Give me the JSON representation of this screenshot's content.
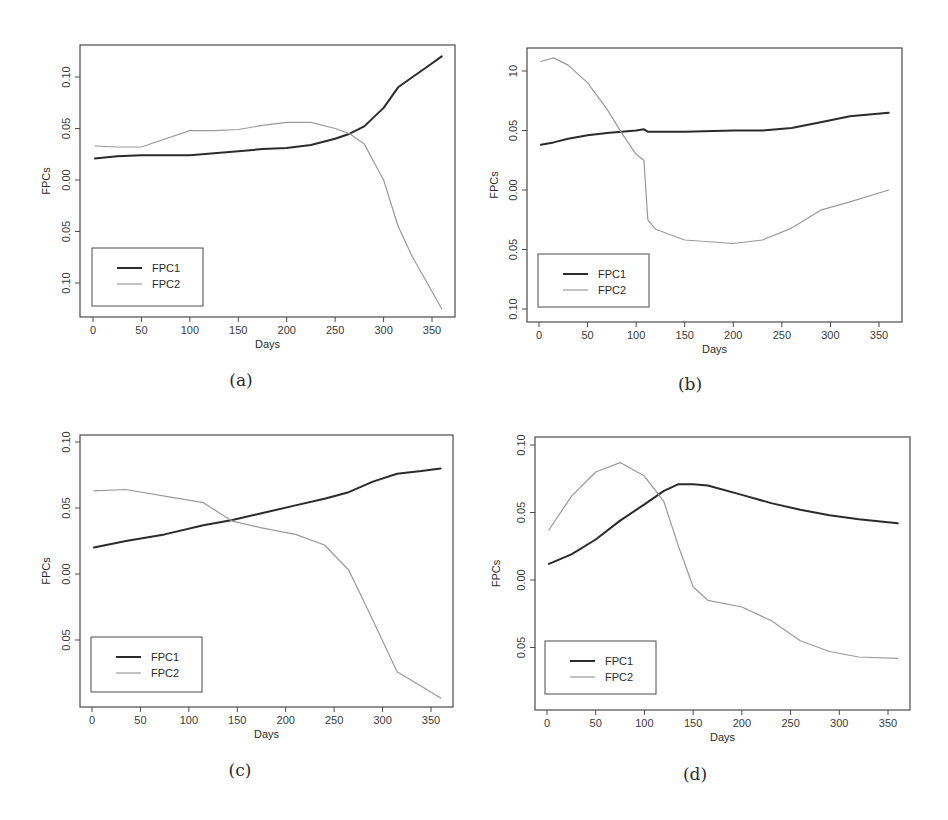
{
  "figure": {
    "panels": [
      "a",
      "b",
      "c",
      "d"
    ]
  },
  "chart_data": [
    {
      "panel": "a",
      "caption": "(a)",
      "type": "line",
      "title": "",
      "xlabel": "Days",
      "ylabel": "FPCs",
      "xticks": [
        0,
        50,
        100,
        150,
        200,
        250,
        300,
        350
      ],
      "xtick_labels": [
        "0",
        "50",
        "100",
        "150",
        "200",
        "250",
        "300",
        "350"
      ],
      "yticks": [
        0.1,
        0.05,
        0.0,
        -0.05,
        -0.1
      ],
      "ytick_labels": [
        "0.10",
        "0.05",
        "0.00",
        "0.05",
        "0.10"
      ],
      "xlim": [
        -12,
        372
      ],
      "ylim": [
        -0.133,
        0.13
      ],
      "grid": false,
      "legend_position": "bottom-left",
      "legend": [
        "FPC1",
        "FPC2"
      ],
      "x": [
        2,
        25,
        50,
        75,
        100,
        125,
        150,
        175,
        200,
        225,
        250,
        265,
        280,
        300,
        315,
        330,
        345,
        360
      ],
      "series": [
        {
          "name": "FPC1",
          "color": "#2b2b2b",
          "width": 2,
          "values": [
            0.021,
            0.023,
            0.024,
            0.024,
            0.024,
            0.026,
            0.028,
            0.03,
            0.031,
            0.034,
            0.04,
            0.045,
            0.052,
            0.07,
            0.09,
            0.1,
            0.11,
            0.12
          ]
        },
        {
          "name": "FPC2",
          "color": "#9a9a9a",
          "width": 1.2,
          "values": [
            0.033,
            0.032,
            0.032,
            0.04,
            0.048,
            0.048,
            0.049,
            0.053,
            0.056,
            0.056,
            0.05,
            0.045,
            0.035,
            0.0,
            -0.045,
            -0.075,
            -0.1,
            -0.125
          ]
        }
      ]
    },
    {
      "panel": "b",
      "caption": "(b)",
      "type": "line",
      "title": "",
      "xlabel": "Days",
      "ylabel": "FPCs",
      "xticks": [
        0,
        50,
        100,
        150,
        200,
        250,
        300,
        350
      ],
      "xtick_labels": [
        "0",
        "50",
        "100",
        "150",
        "200",
        "250",
        "300",
        "350"
      ],
      "yticks": [
        0.1,
        0.05,
        0.0,
        -0.05,
        -0.1
      ],
      "ytick_labels": [
        "10",
        "0.05",
        "0.00",
        "0.05",
        "0.10"
      ],
      "xlim": [
        -12,
        372
      ],
      "ylim": [
        -0.11,
        0.12
      ],
      "grid": false,
      "legend_position": "bottom-left",
      "legend": [
        "FPC1",
        "FPC2"
      ],
      "x": [
        2,
        15,
        30,
        50,
        70,
        85,
        100,
        108,
        112,
        120,
        150,
        200,
        230,
        260,
        290,
        320,
        360
      ],
      "series": [
        {
          "name": "FPC1",
          "color": "#2b2b2b",
          "width": 2,
          "values": [
            0.038,
            0.04,
            0.043,
            0.046,
            0.048,
            0.049,
            0.05,
            0.051,
            0.049,
            0.049,
            0.049,
            0.05,
            0.05,
            0.052,
            0.057,
            0.062,
            0.065
          ]
        },
        {
          "name": "FPC2",
          "color": "#9a9a9a",
          "width": 1.2,
          "values": [
            0.108,
            0.111,
            0.105,
            0.09,
            0.068,
            0.048,
            0.03,
            0.025,
            -0.025,
            -0.033,
            -0.042,
            -0.045,
            -0.042,
            -0.032,
            -0.017,
            -0.01,
            0.0
          ]
        }
      ]
    },
    {
      "panel": "c",
      "caption": "(c)",
      "type": "line",
      "title": "",
      "xlabel": "Days",
      "ylabel": "FPCs",
      "xticks": [
        0,
        50,
        100,
        150,
        200,
        250,
        300,
        350
      ],
      "xtick_labels": [
        "0",
        "50",
        "100",
        "150",
        "200",
        "250",
        "300",
        "350"
      ],
      "yticks": [
        0.1,
        0.05,
        0.0,
        -0.05
      ],
      "ytick_labels": [
        "0.10",
        "0.05",
        "0.00",
        "0.05"
      ],
      "xlim": [
        -12,
        372
      ],
      "ylim": [
        -0.1,
        0.105
      ],
      "grid": false,
      "legend_position": "bottom-left",
      "legend": [
        "FPC1",
        "FPC2"
      ],
      "x": [
        2,
        35,
        75,
        115,
        145,
        175,
        210,
        240,
        265,
        290,
        315,
        340,
        360
      ],
      "series": [
        {
          "name": "FPC1",
          "color": "#2b2b2b",
          "width": 2,
          "values": [
            0.02,
            0.025,
            0.03,
            0.037,
            0.041,
            0.046,
            0.052,
            0.057,
            0.062,
            0.07,
            0.076,
            0.078,
            0.08
          ]
        },
        {
          "name": "FPC2",
          "color": "#9a9a9a",
          "width": 1.2,
          "values": [
            0.063,
            0.064,
            0.059,
            0.054,
            0.04,
            0.035,
            0.03,
            0.022,
            0.003,
            -0.035,
            -0.074,
            -0.085,
            -0.094
          ]
        }
      ]
    },
    {
      "panel": "d",
      "caption": "(d)",
      "type": "line",
      "title": "",
      "xlabel": "Days",
      "ylabel": "FPCs",
      "xticks": [
        0,
        50,
        100,
        150,
        200,
        250,
        300,
        350
      ],
      "xtick_labels": [
        "0",
        "50",
        "100",
        "150",
        "200",
        "250",
        "300",
        "350"
      ],
      "yticks": [
        0.1,
        0.05,
        0.0,
        -0.05
      ],
      "ytick_labels": [
        "0.10",
        "0.05",
        "0.00",
        "0.05"
      ],
      "xlim": [
        -12,
        372
      ],
      "ylim": [
        -0.097,
        0.105
      ],
      "grid": false,
      "legend_position": "bottom-left",
      "legend": [
        "FPC1",
        "FPC2"
      ],
      "x": [
        2,
        25,
        50,
        75,
        100,
        120,
        135,
        150,
        165,
        200,
        230,
        260,
        290,
        320,
        360
      ],
      "series": [
        {
          "name": "FPC1",
          "color": "#2b2b2b",
          "width": 2,
          "values": [
            0.012,
            0.019,
            0.03,
            0.044,
            0.056,
            0.066,
            0.071,
            0.071,
            0.07,
            0.063,
            0.057,
            0.052,
            0.048,
            0.045,
            0.042
          ]
        },
        {
          "name": "FPC2",
          "color": "#9a9a9a",
          "width": 1.2,
          "values": [
            0.037,
            0.062,
            0.08,
            0.087,
            0.077,
            0.058,
            0.025,
            -0.005,
            -0.015,
            -0.02,
            -0.03,
            -0.045,
            -0.053,
            -0.057,
            -0.058
          ]
        }
      ]
    }
  ]
}
